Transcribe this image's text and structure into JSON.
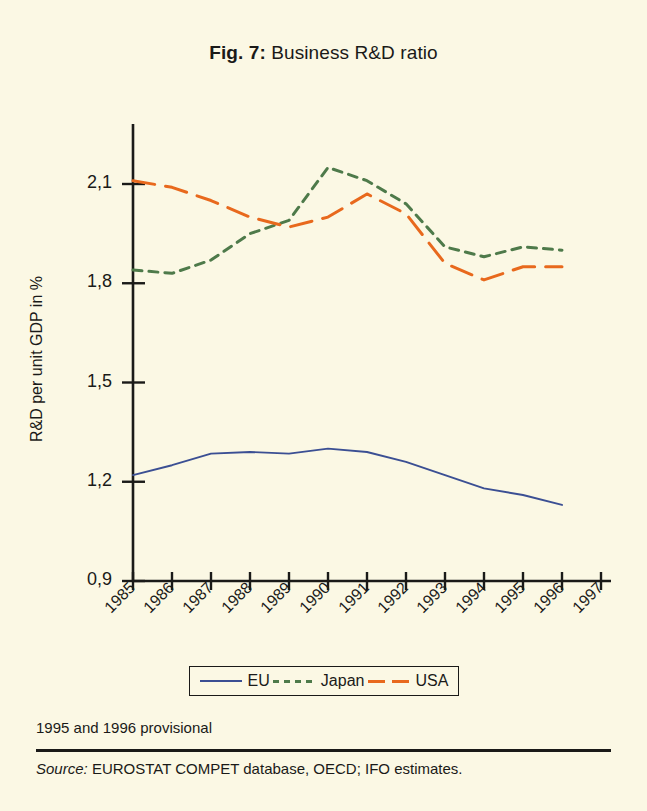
{
  "title": {
    "figure_number": "Fig. 7:",
    "text": "Business R&D ratio"
  },
  "axes": {
    "ylabel": "R&D per unit GDP in %",
    "yticks": [
      "0,9",
      "1,2",
      "1,5",
      "1,8",
      "2,1"
    ],
    "xticks": [
      "1985",
      "1986",
      "1987",
      "1988",
      "1989",
      "1990",
      "1991",
      "1992",
      "1993",
      "1994",
      "1995",
      "1996",
      "1997"
    ]
  },
  "legend": [
    {
      "label": "EU",
      "color": "#3b4f93",
      "style": "solid"
    },
    {
      "label": "Japan",
      "color": "#4e7a4a",
      "style": "dashed"
    },
    {
      "label": "USA",
      "color": "#e8691d",
      "style": "longdash"
    }
  ],
  "notes": {
    "provisional": "1995 and 1996 provisional",
    "source_keyword": "Source:",
    "source_text": "EUROSTAT COMPET database, OECD; IFO estimates."
  },
  "chart_data": {
    "type": "line",
    "title": "Fig. 7: Business R&D ratio",
    "xlabel": "",
    "ylabel": "R&D per unit GDP in %",
    "x": [
      1985,
      1986,
      1987,
      1988,
      1989,
      1990,
      1991,
      1992,
      1993,
      1994,
      1995,
      1996
    ],
    "xlim": [
      1985,
      1997
    ],
    "ylim": [
      0.9,
      2.22
    ],
    "grid": false,
    "legend_position": "bottom",
    "series": [
      {
        "name": "EU",
        "color": "#3b4f93",
        "style": "solid",
        "values": [
          1.22,
          1.25,
          1.285,
          1.29,
          1.285,
          1.3,
          1.29,
          1.26,
          1.22,
          1.18,
          1.16,
          1.13
        ]
      },
      {
        "name": "Japan",
        "color": "#4e7a4a",
        "style": "dashed",
        "values": [
          1.84,
          1.83,
          1.87,
          1.95,
          1.99,
          2.15,
          2.11,
          2.04,
          1.91,
          1.88,
          1.91,
          1.9
        ]
      },
      {
        "name": "USA",
        "color": "#e8691d",
        "style": "longdash",
        "values": [
          2.11,
          2.09,
          2.05,
          2.0,
          1.97,
          2.0,
          2.07,
          2.01,
          1.86,
          1.81,
          1.85,
          1.85
        ]
      }
    ]
  }
}
